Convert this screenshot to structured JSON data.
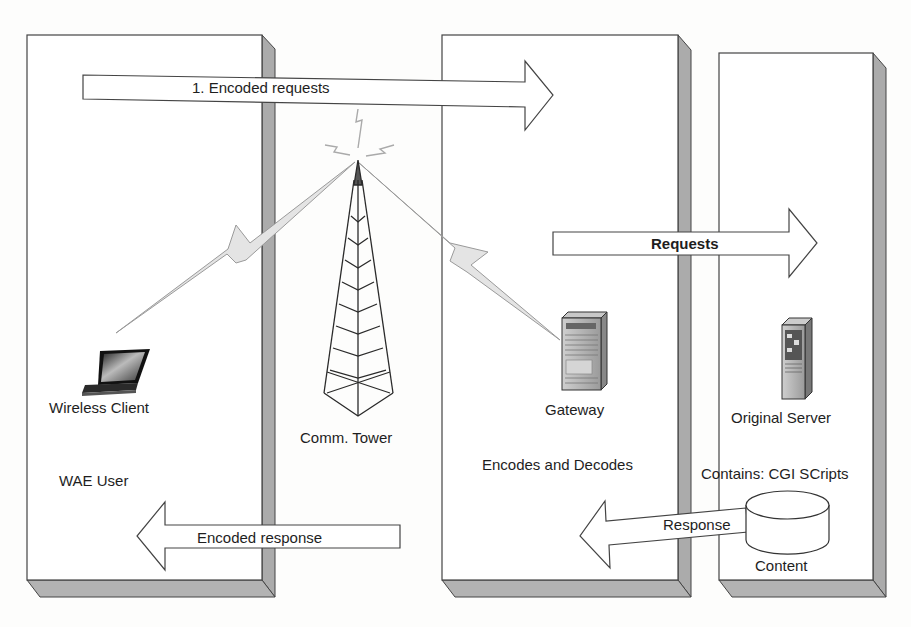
{
  "diagram": {
    "type": "WAP architecture flow",
    "panels": [
      {
        "id": "wae-user",
        "label": "WAE User"
      },
      {
        "id": "gateway",
        "label": "Encodes and Decodes"
      },
      {
        "id": "origin",
        "label": ""
      }
    ],
    "nodes": {
      "wireless_client": "Wireless Client",
      "comm_tower": "Comm. Tower",
      "gateway": "Gateway",
      "original_server": "Original Server",
      "content": "Content",
      "content_note": "Contains: CGI SCripts"
    },
    "panel_labels": {
      "wae_user": "WAE User",
      "gateway_role": "Encodes and Decodes"
    },
    "arrows": {
      "encoded_requests": "1. Encoded requests",
      "requests": "Requests",
      "response": "Response",
      "encoded_response": "Encoded response"
    },
    "colors": {
      "panel_fill": "#ffffff",
      "panel_shadow": "#aaaaaa",
      "outline": "#333333",
      "lightning": "#e2e2e2"
    }
  }
}
